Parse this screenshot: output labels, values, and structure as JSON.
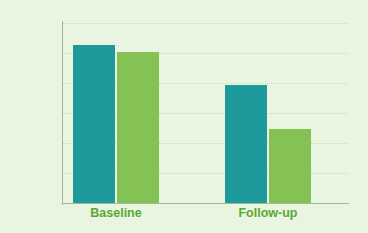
{
  "chart_data": {
    "type": "bar",
    "title": "",
    "xlabel": "",
    "ylabel": "",
    "categories": [
      "Baseline",
      "Follow-up"
    ],
    "series": [
      {
        "name": "Series 1",
        "color": "#1f9a9c",
        "values": [
          26.3,
          19.6
        ]
      },
      {
        "name": "Series 2",
        "color": "#85c255",
        "values": [
          25.2,
          12.4
        ]
      }
    ],
    "ylim": [
      0,
      30
    ],
    "yticks": [
      0,
      5,
      10,
      15,
      20,
      25,
      30
    ],
    "ytick_labels": [
      "0",
      "5",
      "10",
      "15",
      "20",
      "25",
      "30"
    ],
    "grid": true,
    "legend": "none",
    "background_color": "#e9f5e1",
    "axis_color": "#9bbf8c",
    "gridline_color": "#c2ddb4",
    "tick_label_color": "#4b4b4b",
    "category_label_color": "#5aa832"
  }
}
